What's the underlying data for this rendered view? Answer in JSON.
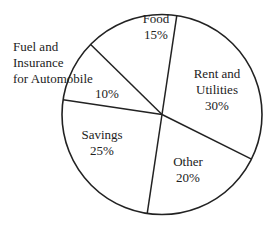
{
  "chart_data": {
    "type": "pie",
    "title": "",
    "categories": [
      "Food",
      "Rent and Utilities",
      "Other",
      "Savings",
      "Fuel and Insurance for Automobile"
    ],
    "values": [
      15,
      30,
      20,
      25,
      10
    ],
    "unit": "%",
    "legend": "none (labels inside/adjacent to slices)",
    "slices": [
      {
        "label": "Food",
        "value": 15,
        "value_label": "15%"
      },
      {
        "label": "Rent and Utilities",
        "value": 30,
        "value_label": "30%"
      },
      {
        "label": "Other",
        "value": 20,
        "value_label": "20%"
      },
      {
        "label": "Savings",
        "value": 25,
        "value_label": "25%"
      },
      {
        "label": "Fuel and Insurance for Automobile",
        "value": 10,
        "value_label": "10%"
      }
    ],
    "style": {
      "fill": "#ffffff",
      "stroke": "#222222"
    }
  },
  "labels": {
    "food": {
      "line1": "Food",
      "line2": "15%"
    },
    "rent": {
      "line1": "Rent and",
      "line2": "Utilities",
      "line3": "30%"
    },
    "other": {
      "line1": "Other",
      "line2": "20%"
    },
    "savings": {
      "line1": "Savings",
      "line2": "25%"
    },
    "fuel": {
      "line1": "Fuel and",
      "line2": "Insurance",
      "line3": "for Automobile",
      "pct": "10%"
    }
  }
}
